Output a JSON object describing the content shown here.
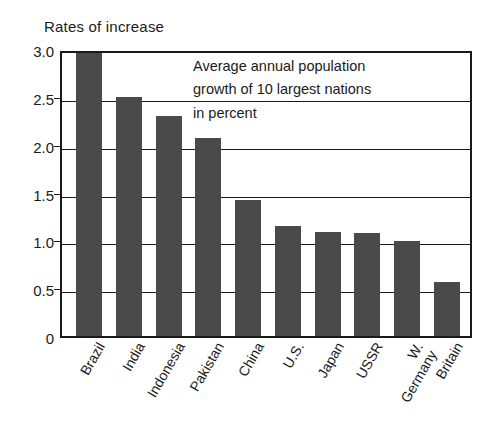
{
  "chart_data": {
    "type": "bar",
    "title": "Rates of increase",
    "xlabel": "",
    "ylabel": "Rates of increase",
    "ylim": [
      0,
      3.0
    ],
    "grid": true,
    "legend": "none",
    "annotation": [
      "Average annual population",
      "growth of 10 largest nations",
      "in percent"
    ],
    "categories": [
      "Brazil",
      "India",
      "Indonesia",
      "Pakistan",
      "China",
      "U.S.",
      "Japan",
      "USSR",
      "W. Germany",
      "Britain"
    ],
    "values": [
      3.0,
      2.5,
      2.3,
      2.07,
      1.42,
      1.15,
      1.09,
      1.08,
      0.99,
      0.56
    ],
    "y_ticks": [
      "0",
      "0.5",
      "1.0",
      "1.5",
      "2.0",
      "2.5",
      "3.0"
    ],
    "y_tick_values": [
      0,
      0.5,
      1.0,
      1.5,
      2.0,
      2.5,
      3.0
    ],
    "bar_color": "#4a4a4a",
    "axis_color": "#1a1a1a",
    "background_color": "#ffffff"
  },
  "x_labels": [
    {
      "line1": "Brazil",
      "line2": ""
    },
    {
      "line1": "India",
      "line2": ""
    },
    {
      "line1": "Indonesia",
      "line2": ""
    },
    {
      "line1": "Pakistan",
      "line2": ""
    },
    {
      "line1": "China",
      "line2": ""
    },
    {
      "line1": "U.S.",
      "line2": ""
    },
    {
      "line1": "Japan",
      "line2": ""
    },
    {
      "line1": "USSR",
      "line2": ""
    },
    {
      "line1": "W.",
      "line2": "Germany"
    },
    {
      "line1": "Britain",
      "line2": ""
    }
  ]
}
